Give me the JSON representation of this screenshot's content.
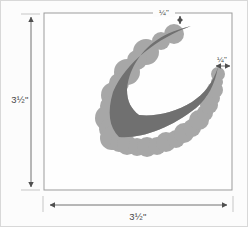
{
  "diagram": {
    "labels": {
      "height": "3½\"",
      "width": "3½\"",
      "top_offset": "¼\"",
      "right_offset": "¼\""
    },
    "colors": {
      "letter": "#707070",
      "scallop": "#a7a7a7",
      "square_fill": "#fefefe",
      "square_border": "#9b9b9b",
      "dimension": "#4f4f4f",
      "extension": "#b9b9b9",
      "background": "#fcfcfc"
    }
  }
}
